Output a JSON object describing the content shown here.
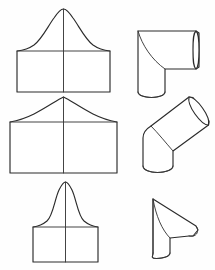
{
  "figure": {
    "background_color": "#fefefe",
    "line_color": "#2b2b2b",
    "fill_color": "#ffffff",
    "width": 215,
    "height": 270,
    "columns": [
      {
        "name": "flat-pattern-developments",
        "position": "left"
      },
      {
        "name": "three-dimensional-fittings",
        "position": "right"
      }
    ]
  },
  "items": [
    {
      "id": "row-1",
      "pattern": {
        "name": "bell-curve-pattern",
        "description": "Rectangle with broad symmetric bell-curve top and vertical centre seam line",
        "rect": {
          "x": 17,
          "y": 51,
          "width": 93,
          "height": 41
        },
        "peak": {
          "x": 63.5,
          "y": 9
        },
        "centerline": {
          "x": 63.5,
          "y_top": 9,
          "y_bottom": 92
        },
        "midline": {
          "y": 51,
          "x_start": 17,
          "x_end": 110
        }
      },
      "fitting": {
        "name": "ninety-degree-elbow",
        "description": "Square-throat 90 degree elbow with horizontal run and vertical drop",
        "angle_degrees": 90
      }
    },
    {
      "id": "row-2",
      "pattern": {
        "name": "gable-curve-pattern",
        "description": "Wide rectangle with shallow curved gable top and vertical centre seam line",
        "rect": {
          "x": 10,
          "y": 122,
          "width": 107,
          "height": 51
        },
        "peak": {
          "x": 63.5,
          "y": 97
        },
        "centerline": {
          "x": 63.5,
          "y_top": 97,
          "y_bottom": 173
        },
        "midline": {
          "y": 122,
          "x_start": 10,
          "x_end": 117
        }
      },
      "fitting": {
        "name": "forty-five-degree-offset-elbow",
        "description": "Angled offset elbow with tilted open end ellipse",
        "angle_degrees": 45
      }
    },
    {
      "id": "row-3",
      "pattern": {
        "name": "tall-peak-pattern",
        "description": "Narrow rectangle with tall narrow bell peak and vertical centre seam line",
        "rect": {
          "x": 33,
          "y": 227,
          "width": 65,
          "height": 35
        },
        "peak": {
          "x": 65.5,
          "y": 182
        },
        "centerline": {
          "x": 65.5,
          "y_top": 182,
          "y_bottom": 262
        },
        "midline": {
          "y": 227,
          "x_start": 33,
          "x_end": 98
        }
      },
      "fitting": {
        "name": "oblique-cone-taper-transition",
        "description": "Oblique conical taper from round cylinder to a narrow pointed outlet",
        "angle_degrees": 45
      }
    }
  ]
}
